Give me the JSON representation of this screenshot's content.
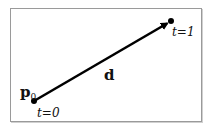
{
  "diagram": {
    "start_point": {
      "label": "p",
      "subscript": "0",
      "param": "t=0",
      "x": 34,
      "y": 101
    },
    "end_point": {
      "param": "t=1",
      "x": 171,
      "y": 21
    },
    "vector": {
      "label": "d"
    },
    "colors": {
      "line": "#000000",
      "border": "#9a9a9a"
    }
  }
}
